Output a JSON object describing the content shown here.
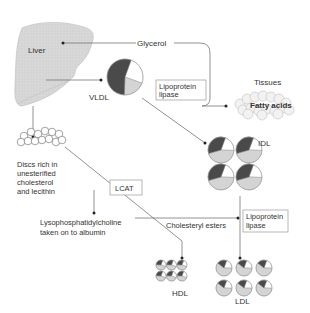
{
  "labels": {
    "liver": "Liver",
    "glycerol": "Glycerol",
    "vldl": "VLDL",
    "tissues": "Tissues",
    "fatty_acids": "Fatty acids",
    "lipoprotein_lipase_1": [
      "Lipoprotein",
      "lipase"
    ],
    "idl": "IDL",
    "discs": [
      "Discs rich in",
      "unesterified",
      "cholesterol",
      "and lecithin"
    ],
    "lcat": "LCAT",
    "lyso": [
      "Lysophosphatidylcholine",
      "taken on to albumin"
    ],
    "cholesteryl_esters": "Cholesteryl esters",
    "lipoprotein_lipase_2": [
      "Lipoprotein",
      "lipase"
    ],
    "hdl": "HDL",
    "ldl": "LDL"
  },
  "colors": {
    "liver_fill": "#d6d6d6",
    "pie_dark": "#4a4a4a",
    "pie_light": "#d4d4d4",
    "pie_white": "#ffffff",
    "line": "#777777"
  },
  "particles": {
    "vldl": {
      "count": 1,
      "composition": {
        "dark": 0.55,
        "light": 0.2,
        "white": 0.25
      }
    },
    "idl": {
      "count": 4,
      "composition": {
        "dark": 0.35,
        "light": 0.45,
        "white": 0.2
      }
    },
    "ldl": {
      "count": 6,
      "composition": {
        "dark": 0.2,
        "light": 0.6,
        "white": 0.2
      }
    },
    "hdl": {
      "count": 6,
      "composition": {
        "dark": 0.3,
        "light": 0.45,
        "white": 0.25
      }
    }
  }
}
